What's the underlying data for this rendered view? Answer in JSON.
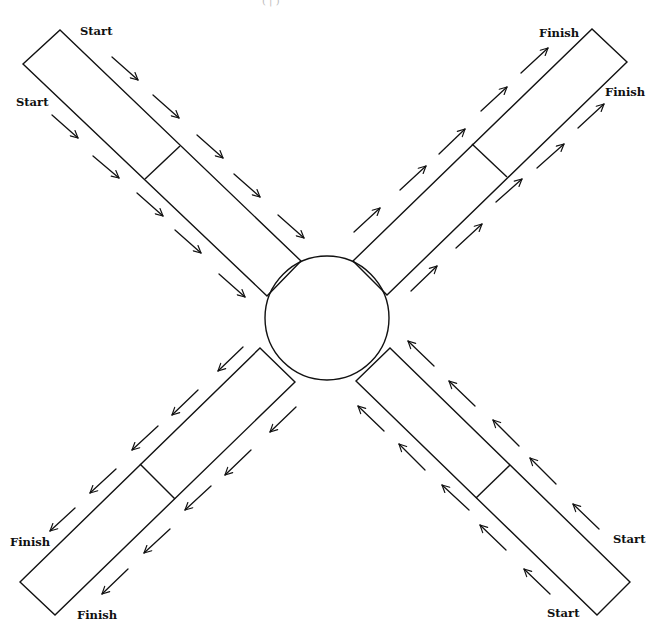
{
  "diagram": {
    "type": "intersection-flow",
    "header_fragment": "( |   )",
    "colors": {
      "stroke": "#111111",
      "background": "#ffffff"
    },
    "center": {
      "shape": "circle",
      "cx": 327,
      "cy": 318,
      "r": 62
    },
    "arms": [
      {
        "id": "top-left",
        "direction": "inbound",
        "flow": "toward-center",
        "corners": [
          [
            60,
            30
          ],
          [
            301,
            261
          ],
          [
            267,
            296
          ],
          [
            23,
            64
          ]
        ],
        "divider": [
          [
            180,
            146
          ],
          [
            145,
            179
          ]
        ],
        "labels": [
          {
            "text": "Start",
            "x": 80,
            "y": 35
          },
          {
            "text": "Start",
            "x": 16,
            "y": 106
          }
        ],
        "arrows": [
          [
            [
              112,
              57
            ],
            [
              138,
              80
            ]
          ],
          [
            [
              153,
              95
            ],
            [
              179,
              118
            ]
          ],
          [
            [
              197,
              135
            ],
            [
              223,
              158
            ]
          ],
          [
            [
              234,
              174
            ],
            [
              260,
              197
            ]
          ],
          [
            [
              278,
              215
            ],
            [
              304,
              238
            ]
          ],
          [
            [
              52,
              115
            ],
            [
              78,
              138
            ]
          ],
          [
            [
              93,
              156
            ],
            [
              119,
              178
            ]
          ],
          [
            [
              137,
              193
            ],
            [
              163,
              216
            ]
          ],
          [
            [
              175,
              230
            ],
            [
              201,
              253
            ]
          ],
          [
            [
              219,
              274
            ],
            [
              245,
              297
            ]
          ]
        ]
      },
      {
        "id": "top-right",
        "direction": "outbound",
        "flow": "away-from-center",
        "corners": [
          [
            353,
            261
          ],
          [
            592,
            29
          ],
          [
            627,
            62
          ],
          [
            387,
            295
          ]
        ],
        "divider": [
          [
            472,
            144
          ],
          [
            507,
            177
          ]
        ],
        "labels": [
          {
            "text": "Finish",
            "x": 539,
            "y": 37
          },
          {
            "text": "Finish",
            "x": 605,
            "y": 96
          }
        ],
        "arrows": [
          [
            [
              354,
              232
            ],
            [
              380,
              208
            ]
          ],
          [
            [
              400,
              190
            ],
            [
              426,
              166
            ]
          ],
          [
            [
              439,
              154
            ],
            [
              465,
              129
            ]
          ],
          [
            [
              481,
              111
            ],
            [
              507,
              87
            ]
          ],
          [
            [
              521,
              73
            ],
            [
              548,
              48
            ]
          ],
          [
            [
              411,
              291
            ],
            [
              437,
              266
            ]
          ],
          [
            [
              456,
              248
            ],
            [
              482,
              224
            ]
          ],
          [
            [
              496,
              202
            ],
            [
              522,
              179
            ]
          ],
          [
            [
              537,
              168
            ],
            [
              564,
              144
            ]
          ],
          [
            [
              578,
              128
            ],
            [
              604,
              104
            ]
          ]
        ]
      },
      {
        "id": "bottom-left",
        "direction": "outbound",
        "flow": "away-from-center",
        "corners": [
          [
            260,
            348
          ],
          [
            295,
            382
          ],
          [
            55,
            615
          ],
          [
            20,
            582
          ]
        ],
        "divider": [
          [
            140,
            464
          ],
          [
            175,
            499
          ]
        ],
        "labels": [
          {
            "text": "Finish",
            "x": 10,
            "y": 546
          },
          {
            "text": "Finish",
            "x": 77,
            "y": 619
          }
        ],
        "arrows": [
          [
            [
              243,
              347
            ],
            [
              218,
              371
            ]
          ],
          [
            [
              198,
              390
            ],
            [
              172,
              415
            ]
          ],
          [
            [
              158,
              426
            ],
            [
              132,
              450
            ]
          ],
          [
            [
              116,
              469
            ],
            [
              90,
              493
            ]
          ],
          [
            [
              75,
              508
            ],
            [
              50,
              531
            ]
          ],
          [
            [
              296,
              407
            ],
            [
              270,
              432
            ]
          ],
          [
            [
              251,
              450
            ],
            [
              225,
              475
            ]
          ],
          [
            [
              211,
              486
            ],
            [
              185,
              510
            ]
          ],
          [
            [
              170,
              529
            ],
            [
              144,
              553
            ]
          ],
          [
            [
              128,
              569
            ],
            [
              102,
              594
            ]
          ]
        ]
      },
      {
        "id": "bottom-right",
        "direction": "inbound",
        "flow": "toward-center",
        "corners": [
          [
            390,
            348
          ],
          [
            630,
            582
          ],
          [
            597,
            615
          ],
          [
            356,
            381
          ]
        ],
        "divider": [
          [
            510,
            465
          ],
          [
            476,
            498
          ]
        ],
        "labels": [
          {
            "text": "Start",
            "x": 613,
            "y": 543
          },
          {
            "text": "Start",
            "x": 547,
            "y": 617
          }
        ],
        "arrows": [
          [
            [
              434,
              366
            ],
            [
              408,
              341
            ]
          ],
          [
            [
              475,
              406
            ],
            [
              449,
              381
            ]
          ],
          [
            [
              519,
              446
            ],
            [
              493,
              420
            ]
          ],
          [
            [
              556,
              484
            ],
            [
              530,
              458
            ]
          ],
          [
            [
              599,
              529
            ],
            [
              573,
              504
            ]
          ],
          [
            [
              384,
              431
            ],
            [
              358,
              406
            ]
          ],
          [
            [
              425,
              470
            ],
            [
              399,
              444
            ]
          ],
          [
            [
              469,
              510
            ],
            [
              442,
              485
            ]
          ],
          [
            [
              506,
              550
            ],
            [
              480,
              525
            ]
          ],
          [
            [
              550,
              594
            ],
            [
              524,
              569
            ]
          ]
        ]
      }
    ]
  }
}
